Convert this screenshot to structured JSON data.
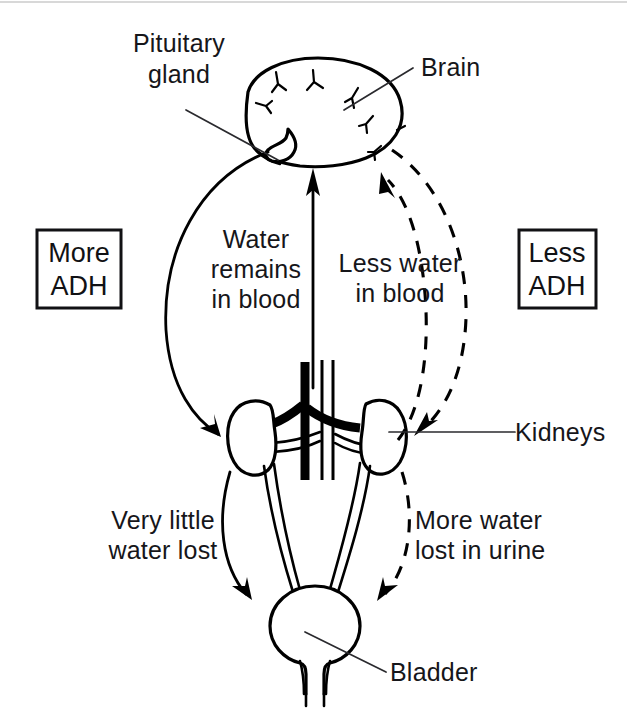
{
  "figure": {
    "background_color": "#ffffff",
    "ink_color": "#000000",
    "width": 627,
    "height": 712
  },
  "boxes": {
    "left": {
      "line1": "More",
      "line2": "ADH"
    },
    "right": {
      "line1": "Less",
      "line2": "ADH"
    }
  },
  "organ_labels": {
    "pituitary": {
      "line1": "Pituitary",
      "line2": "gland"
    },
    "brain": "Brain",
    "kidneys": "Kidneys",
    "bladder": "Bladder"
  },
  "flow_labels": {
    "water_remains": {
      "line1": "Water",
      "line2": "remains",
      "line3": "in blood"
    },
    "less_water": {
      "line1": "Less water",
      "line2": "in blood"
    },
    "very_little": {
      "line1": "Very  little",
      "line2": "water lost"
    },
    "more_water": {
      "line1": "More water",
      "line2": "lost in urine"
    }
  },
  "icons": {
    "brain": "brain-icon",
    "pituitary": "pituitary-gland-icon",
    "kidney_left": "left-kidney-icon",
    "kidney_right": "right-kidney-icon",
    "bladder": "bladder-icon",
    "aorta": "aorta-icon",
    "vena_cava": "vena-cava-icon",
    "ureter_left": "left-ureter-icon",
    "ureter_right": "right-ureter-icon",
    "urethra": "urethra-icon"
  },
  "arrows": {
    "adh_to_kidney": "solid-arc-pituitary-to-left-kidney",
    "water_to_brain": "straight-arrow-kidney-to-brain",
    "blood_to_brain_dashed": "dashed-arc-kidney-to-brain",
    "brain_to_kidney_dashed": "dashed-arc-brain-to-right-kidney",
    "little_water_lost": "solid-arc-kidney-to-bladder",
    "more_water_lost": "dashed-arc-kidney-to-bladder"
  }
}
